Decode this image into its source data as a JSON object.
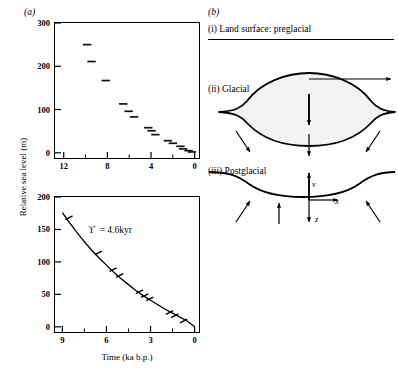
{
  "figure": {
    "panel_a_label": "(a)",
    "panel_b_label": "(b)"
  },
  "panel_a": {
    "y_axis_title": "Relative sea level (m)",
    "x_axis_title": "Time (ka b.p.)"
  },
  "panel_b": {
    "stage_i": "(i) Land surface:  preglacial",
    "stage_ii": "(ii) Glacial",
    "stage_iii": "(iii) Postglacial",
    "ice_label": "ICE",
    "radius_label": "R",
    "u_label": "u",
    "v_label": "v",
    "x_label": "x",
    "z_label": "z"
  },
  "chart_data": [
    {
      "type": "scatter",
      "id": "upper-sea-level",
      "title": "",
      "xlabel": "Time (ka b.p.)",
      "ylabel": "Relative sea level (m)",
      "xlim": [
        12.8,
        -0.4
      ],
      "ylim": [
        -12,
        300
      ],
      "x_reversed": true,
      "grid": false,
      "legend": null,
      "xticks": [
        12,
        8,
        4,
        0
      ],
      "xticks_minor": [
        10,
        6,
        2
      ],
      "yticks": [
        0,
        100,
        200,
        300
      ],
      "marker": "horizontal-dash",
      "points": [
        {
          "x": 9.85,
          "y": 250
        },
        {
          "x": 9.45,
          "y": 211
        },
        {
          "x": 8.15,
          "y": 167
        },
        {
          "x": 6.55,
          "y": 113
        },
        {
          "x": 6.05,
          "y": 96
        },
        {
          "x": 5.55,
          "y": 83
        },
        {
          "x": 4.25,
          "y": 58
        },
        {
          "x": 3.95,
          "y": 51
        },
        {
          "x": 3.6,
          "y": 42
        },
        {
          "x": 2.45,
          "y": 28
        },
        {
          "x": 2.0,
          "y": 22
        },
        {
          "x": 1.3,
          "y": 15
        },
        {
          "x": 1.05,
          "y": 9
        },
        {
          "x": 0.55,
          "y": 5
        },
        {
          "x": 0.25,
          "y": 2
        }
      ]
    },
    {
      "type": "line",
      "id": "lower-exponential-decay",
      "title": "",
      "annotation": "ϒ = 4.6 kyr",
      "annotation_symbol": "ϒ",
      "annotation_value": "4.6",
      "annotation_unit": "kyr",
      "xlabel": "Time (ka b.p.)",
      "ylabel": "Relative sea level (m)",
      "xlim": [
        9.5,
        -0.3
      ],
      "ylim": [
        -8,
        200
      ],
      "x_reversed": true,
      "grid": false,
      "legend": null,
      "xticks": [
        9,
        6,
        3,
        0
      ],
      "xticks_minor": [
        7.5,
        4.5,
        1.5
      ],
      "yticks": [
        0,
        50,
        100,
        150,
        200
      ],
      "model": "exponential decay, relaxation time 4.6 kyr",
      "curve_x": [
        9.0,
        8.5,
        8.0,
        7.5,
        7.0,
        6.5,
        6.0,
        5.5,
        5.0,
        4.5,
        4.0,
        3.5,
        3.0,
        2.5,
        2.0,
        1.5,
        1.0,
        0.5,
        0.0
      ],
      "curve_y": [
        176,
        160,
        145,
        131,
        118,
        106,
        95,
        84,
        74,
        65,
        56,
        48,
        41,
        34,
        27,
        21,
        15,
        9,
        0
      ],
      "data_points": [
        {
          "x": 8.55,
          "y": 168
        },
        {
          "x": 6.55,
          "y": 114
        },
        {
          "x": 5.55,
          "y": 88
        },
        {
          "x": 5.1,
          "y": 79
        },
        {
          "x": 3.75,
          "y": 54
        },
        {
          "x": 3.4,
          "y": 48
        },
        {
          "x": 3.05,
          "y": 43
        },
        {
          "x": 1.7,
          "y": 22
        },
        {
          "x": 1.35,
          "y": 17
        },
        {
          "x": 0.75,
          "y": 9
        }
      ]
    }
  ]
}
